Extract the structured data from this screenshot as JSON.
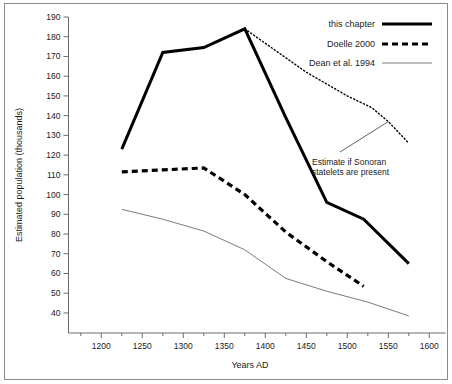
{
  "chart_data": {
    "type": "line",
    "title": "",
    "xlabel": "Years AD",
    "ylabel": "Estimated population (thousands)",
    "xlim": [
      1160,
      1620
    ],
    "ylim": [
      33,
      190
    ],
    "xticks": [
      1200,
      1250,
      1300,
      1350,
      1400,
      1450,
      1500,
      1550,
      1600
    ],
    "yticks": [
      40,
      50,
      60,
      70,
      80,
      90,
      100,
      110,
      120,
      130,
      140,
      150,
      160,
      170,
      180,
      190
    ],
    "grid": false,
    "legend_position": "top-right",
    "series": [
      {
        "name": "this chapter",
        "style": "thick-solid",
        "color": "#000000",
        "x": [
          1225,
          1275,
          1325,
          1375,
          1425,
          1475,
          1520,
          1575
        ],
        "values": [
          123,
          172,
          174.5,
          184,
          139,
          96,
          87.5,
          65
        ]
      },
      {
        "name": "Estimate if Sonoran statelets are present",
        "style": "dotted",
        "color": "#000000",
        "x": [
          1375,
          1450,
          1500,
          1530,
          1550,
          1575
        ],
        "values": [
          184,
          162,
          150,
          144,
          137,
          126
        ]
      },
      {
        "name": "Doelle 2000",
        "style": "thick-dashed",
        "color": "#000000",
        "x": [
          1225,
          1275,
          1325,
          1375,
          1425,
          1475,
          1520
        ],
        "values": [
          111.5,
          112.5,
          113.5,
          100,
          81,
          66,
          53.5
        ]
      },
      {
        "name": "Dean et al. 1994",
        "style": "thin-solid",
        "color": "#6b6b6b",
        "x": [
          1225,
          1275,
          1325,
          1375,
          1425,
          1475,
          1525,
          1575
        ],
        "values": [
          92.5,
          87.5,
          81.5,
          72,
          57.5,
          51,
          45.5,
          38.5
        ]
      }
    ],
    "annotations": [
      {
        "text_line1": "Estimate if Sonoran",
        "text_line2": "statelets are present",
        "points_to_x": 1550,
        "points_to_y": 137
      }
    ]
  },
  "legend": {
    "entries": [
      {
        "label": "this chapter",
        "style": "thick-solid"
      },
      {
        "label": "Doelle 2000",
        "style": "thick-dashed"
      },
      {
        "label": "Dean et al. 1994",
        "style": "thin-solid"
      }
    ]
  },
  "axes": {
    "y_title": "Estimated population (thousands)",
    "x_title": "Years AD",
    "y_tick_labels": [
      "190",
      "180",
      "170",
      "160",
      "150",
      "140",
      "130",
      "120",
      "110",
      "100",
      "90",
      "80",
      "70",
      "60",
      "50",
      "40"
    ],
    "x_tick_labels": [
      "1200",
      "1250",
      "1300",
      "1350",
      "1400",
      "1450",
      "1500",
      "1550",
      "1600"
    ]
  },
  "annotation": {
    "line1": "Estimate if Sonoran",
    "line2": "statelets are present"
  },
  "colors": {
    "ink": "#000000",
    "axis": "#6b6b6b",
    "thin_series": "#6b6b6b",
    "frame": "#8c8c8c",
    "background": "#ffffff"
  }
}
